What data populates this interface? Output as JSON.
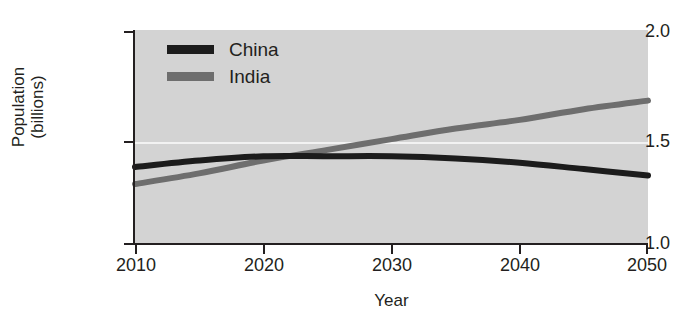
{
  "chart_data": {
    "type": "line",
    "title": "",
    "xlabel": "Year",
    "ylabel": "Population (billions)",
    "ylabel_line1": "Population",
    "ylabel_line2": "(billions)",
    "xlim": [
      2010,
      2050
    ],
    "ylim": [
      1.0,
      2.0
    ],
    "xticks": [
      "2010",
      "2020",
      "2030",
      "2040",
      "2050"
    ],
    "yticks": [
      "2.0",
      "1.5",
      "1.0"
    ],
    "grid": "horizontal gridline at 1.5 only",
    "legend_position": "top-left inside plot",
    "x": [
      2010,
      2015,
      2020,
      2025,
      2030,
      2035,
      2040,
      2045,
      2050
    ],
    "series": [
      {
        "name": "China",
        "color": "#1c1c1c",
        "values": [
          1.36,
          1.39,
          1.41,
          1.41,
          1.41,
          1.4,
          1.38,
          1.35,
          1.32
        ]
      },
      {
        "name": "India",
        "color": "#6e6e6e",
        "values": [
          1.28,
          1.33,
          1.39,
          1.44,
          1.49,
          1.54,
          1.58,
          1.63,
          1.67
        ]
      }
    ],
    "annotations": [
      "India curve crosses above China curve near 2024"
    ]
  },
  "legend": {
    "items": [
      {
        "label": "China",
        "color": "#1c1c1c"
      },
      {
        "label": "India",
        "color": "#6e6e6e"
      }
    ]
  },
  "axes": {
    "x_title": "Year",
    "y_title_line1": "Population",
    "y_title_line2": "(billions)",
    "y_tick_top": "2.0",
    "y_tick_mid": "1.5",
    "y_tick_bottom": "1.0",
    "x_tick_1": "2010",
    "x_tick_2": "2020",
    "x_tick_3": "2030",
    "x_tick_4": "2040",
    "x_tick_5": "2050"
  },
  "colors": {
    "plot_background": "#d3d3d3",
    "gridline": "#f2f2f2",
    "axis": "#231f20",
    "china": "#1c1c1c",
    "india": "#6e6e6e"
  }
}
